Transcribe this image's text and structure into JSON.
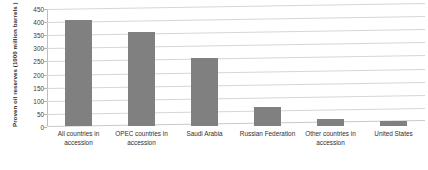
{
  "chart_data": {
    "type": "bar",
    "title": "",
    "subtitle": "",
    "xlabel": "",
    "ylabel": "Proven oil reserves (1000 million barrels )",
    "categories": [
      "All countries in accession",
      "OPEC countries in accession",
      "Saudi Arabia",
      "Russian Federation",
      "Other countries in accession",
      "United States"
    ],
    "values": [
      403,
      360,
      259,
      74,
      25,
      19
    ],
    "ylim": [
      0,
      450
    ],
    "ytick_step": 50,
    "yticks": [
      450,
      400,
      350,
      300,
      250,
      200,
      150,
      100,
      50,
      0
    ],
    "ytick_labels": [
      "450",
      "400",
      "350",
      "300",
      "250",
      "200",
      "150",
      "100",
      "50",
      "0"
    ],
    "grid": true,
    "legend": false,
    "legend_position": "none",
    "bar_color": "#808080",
    "gridline_color": "#d6d6d6",
    "axis_color": "#bdbdbd",
    "background_color": "#ffffff"
  }
}
